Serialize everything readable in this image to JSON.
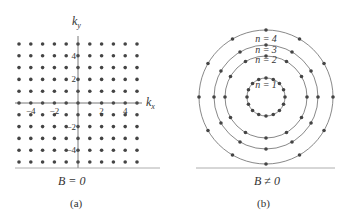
{
  "panel_a": {
    "y_axis_label": "k_y",
    "x_axis_label": "k_x",
    "x_ticks": [
      "−4",
      "−2",
      "2",
      "4"
    ],
    "y_ticks": [
      "4",
      "2",
      "−2",
      "−4"
    ],
    "grid_range": [
      -5,
      5
    ],
    "condition": "B = 0",
    "caption": "(a)"
  },
  "panel_b": {
    "rings": [
      {
        "label": "n = 1",
        "radius": 19,
        "dots": 16
      },
      {
        "label": "n = 2",
        "radius": 41,
        "dots": 12
      },
      {
        "label": "n = 3",
        "radius": 52,
        "dots": 12
      },
      {
        "label": "n = 4",
        "radius": 67,
        "dots": 12
      }
    ],
    "condition": "B ≠ 0",
    "caption": "(b)"
  },
  "colors": {
    "dot": "#444444",
    "line": "#555555",
    "baseline": "#999999"
  }
}
